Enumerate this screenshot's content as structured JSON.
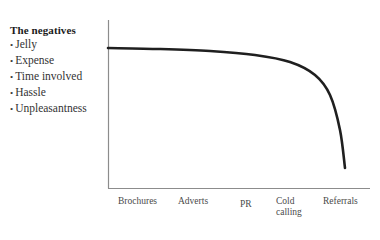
{
  "annotation": {
    "heading": "The negatives",
    "bullet_glyph": "•",
    "items": [
      {
        "label": "Jelly"
      },
      {
        "label": "Expense"
      },
      {
        "label": "Time involved"
      },
      {
        "label": "Hassle"
      },
      {
        "label": "Unpleasantness"
      }
    ]
  },
  "chart_data": {
    "type": "line",
    "title": "",
    "xlabel": "",
    "ylabel": "",
    "grid": false,
    "legend": false,
    "axis_color": "#8c8c8c",
    "line_color": "#1f1f1f",
    "categories": [
      "Brochures",
      "Adverts",
      "PR",
      "Cold calling",
      "Referrals"
    ],
    "tick_labels": [
      {
        "text": "Brochures",
        "line1": "Brochures",
        "line2": ""
      },
      {
        "text": "Adverts",
        "line1": "Adverts",
        "line2": ""
      },
      {
        "text": "PR",
        "line1": "PR",
        "line2": ""
      },
      {
        "text": "Cold calling",
        "line1": "Cold",
        "line2": "calling"
      },
      {
        "text": "Referrals",
        "line1": "Referrals",
        "line2": ""
      }
    ],
    "series": [
      {
        "name": "Effectiveness",
        "values": [
          100,
          97,
          93,
          84,
          8
        ]
      }
    ],
    "xlim": [
      0,
      5
    ],
    "ylim": [
      0,
      100
    ],
    "points": [
      {
        "x": 108,
        "y": 48
      },
      {
        "x": 160,
        "y": 49
      },
      {
        "x": 210,
        "y": 51
      },
      {
        "x": 255,
        "y": 55
      },
      {
        "x": 290,
        "y": 62
      },
      {
        "x": 315,
        "y": 75
      },
      {
        "x": 330,
        "y": 95
      },
      {
        "x": 340,
        "y": 130
      },
      {
        "x": 345,
        "y": 168
      }
    ]
  }
}
